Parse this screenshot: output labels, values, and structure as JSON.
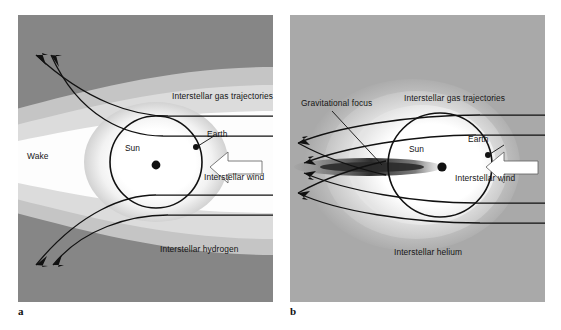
{
  "figure": {
    "panels": [
      {
        "key": "a",
        "marker": "a",
        "medium": "Interstellar hydrogen",
        "background_color": "#868686",
        "cavity_label": "Wake",
        "labels": {
          "trajectories": "Interstellar gas trajectories",
          "earth": "Earth",
          "sun": "Sun",
          "wind": "Interstellar wind",
          "medium": "Interstellar hydrogen",
          "cavity": "Wake"
        }
      },
      {
        "key": "b",
        "marker": "b",
        "medium": "Interstellar helium",
        "background_color": "#a9a9a9",
        "cavity_label": "Gravitational focus",
        "labels": {
          "trajectories": "Interstellar gas trajectories",
          "earth": "Earth",
          "sun": "Sun",
          "wind": "Interstellar wind",
          "medium": "Interstellar helium",
          "focus": "Gravitational focus"
        }
      }
    ],
    "colors": {
      "panel_a_background": "#868686",
      "panel_b_background": "#a9a9a9",
      "mid_gray": "#c3c3c3",
      "light_gray": "#dedede",
      "cavity_white": "#fdfdfd",
      "line": "#111111",
      "arrow_fill": "#ffffff",
      "focus_dark": "#3a3a3a"
    }
  }
}
